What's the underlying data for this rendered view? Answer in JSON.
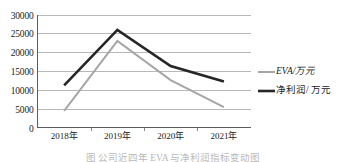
{
  "chart_data": {
    "type": "line",
    "title": "",
    "xlabel": "",
    "ylabel": "",
    "categories": [
      "2018年",
      "2019年",
      "2020年",
      "2021年"
    ],
    "ylim": [
      0,
      30000
    ],
    "yticks": [
      0,
      5000,
      10000,
      15000,
      20000,
      25000,
      30000
    ],
    "ytick_labels": [
      "0",
      "5000",
      "10000",
      "15000",
      "20000",
      "25000",
      "30000"
    ],
    "grid": true,
    "legend_position": "right",
    "series": [
      {
        "name": "EVA/万元",
        "values": [
          4400,
          23000,
          12600,
          5400
        ],
        "color": "#a6a6a6",
        "line_width": 2.0,
        "style": "italic-label"
      },
      {
        "name": "净利润/ 万元",
        "values": [
          11200,
          25900,
          16300,
          12200
        ],
        "color": "#262626",
        "line_width": 2.6,
        "style": "normal-label"
      }
    ]
  },
  "legend": {
    "items": [
      {
        "label": "EVA/万元",
        "color": "#a6a6a6"
      },
      {
        "label": "净利润/ 万元",
        "color": "#262626"
      }
    ]
  },
  "caption": {
    "text": "图   公司近四年 EVA 与净利润指标变动图"
  },
  "colors": {
    "eva_series": "#a6a6a6",
    "net_profit_series": "#262626",
    "gridline": "#9a9a9a",
    "axis": "#4a4a4a",
    "background": "#ffffff"
  }
}
